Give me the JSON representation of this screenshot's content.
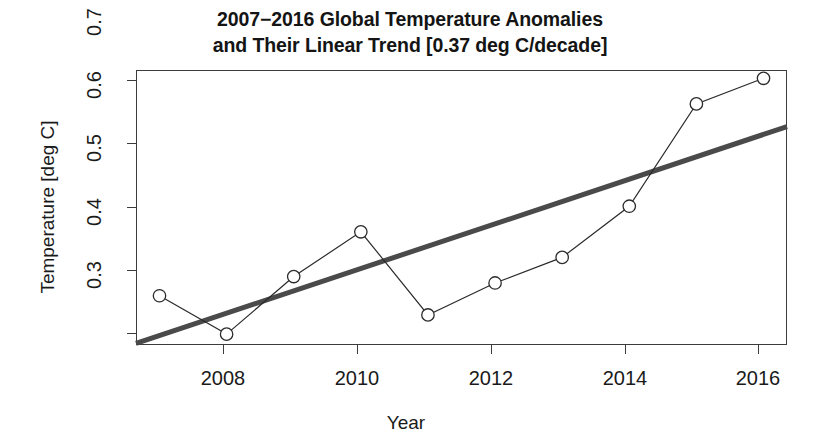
{
  "chart_data": {
    "type": "line",
    "title_lines": [
      "2007−2016 Global Temperature Anomalies",
      "and Their Linear Trend [0.37 deg C/decade]"
    ],
    "xlabel": "Year",
    "ylabel": "Temperature [deg C]",
    "xlim": [
      2006.65,
      2016.35
    ],
    "ylim": [
      0.283,
      0.713
    ],
    "grid": false,
    "legend": null,
    "x": [
      2007,
      2008,
      2009,
      2010,
      2011,
      2012,
      2013,
      2014,
      2015,
      2016
    ],
    "xticks": [
      2008,
      2010,
      2012,
      2014,
      2016
    ],
    "xtick_labels": [
      "2008",
      "2010",
      "2012",
      "2014",
      "2016"
    ],
    "yticks": [
      0.3,
      0.4,
      0.5,
      0.6,
      0.7
    ],
    "ytick_labels": [
      "0.3",
      "0.4",
      "0.5",
      "0.6",
      "0.7"
    ],
    "series": [
      {
        "name": "Global Temperature Anomaly",
        "type": "line-with-markers",
        "marker": "open-circle",
        "color": "#2b2b2b",
        "line_width": 1.2,
        "values": [
          0.36,
          0.3,
          0.39,
          0.46,
          0.33,
          0.38,
          0.42,
          0.5,
          0.66,
          0.7
        ]
      },
      {
        "name": "Linear Trend",
        "type": "line",
        "color": "#4a4a4a",
        "line_width": 5,
        "slope_per_decade": 0.37,
        "endpoints": [
          {
            "x": 2006.65,
            "y": 0.2855
          },
          {
            "x": 2016.35,
            "y": 0.6245
          }
        ]
      }
    ]
  }
}
